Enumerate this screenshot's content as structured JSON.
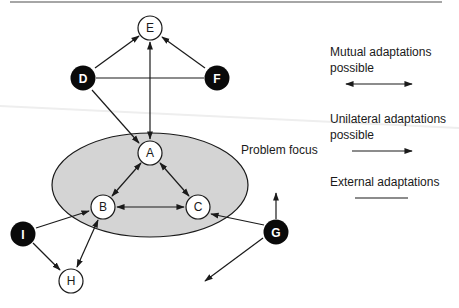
{
  "diagram": {
    "nodes": [
      {
        "id": "E",
        "label": "E",
        "type": "internal",
        "x": 150,
        "y": 28
      },
      {
        "id": "D",
        "label": "D",
        "type": "external",
        "x": 83,
        "y": 78
      },
      {
        "id": "F",
        "label": "F",
        "type": "external",
        "x": 217,
        "y": 78
      },
      {
        "id": "A",
        "label": "A",
        "type": "internal",
        "x": 150,
        "y": 153
      },
      {
        "id": "B",
        "label": "B",
        "type": "internal",
        "x": 103,
        "y": 207
      },
      {
        "id": "C",
        "label": "C",
        "type": "internal",
        "x": 198,
        "y": 207
      },
      {
        "id": "I",
        "label": "I",
        "type": "external",
        "x": 23,
        "y": 233
      },
      {
        "id": "H",
        "label": "H",
        "type": "internal",
        "x": 71,
        "y": 281
      },
      {
        "id": "G",
        "label": "G",
        "type": "external",
        "x": 276,
        "y": 232
      }
    ],
    "edges": [
      {
        "from": "D",
        "to": "E",
        "kind": "unilateral"
      },
      {
        "from": "F",
        "to": "E",
        "kind": "unilateral"
      },
      {
        "from": "D",
        "to": "F",
        "kind": "external"
      },
      {
        "from": "E",
        "to": "A",
        "kind": "mutual"
      },
      {
        "from": "D",
        "to": "A",
        "kind": "unilateral"
      },
      {
        "from": "A",
        "to": "B",
        "kind": "mutual"
      },
      {
        "from": "A",
        "to": "C",
        "kind": "mutual"
      },
      {
        "from": "B",
        "to": "C",
        "kind": "mutual"
      },
      {
        "from": "I",
        "to": "B",
        "kind": "unilateral"
      },
      {
        "from": "I",
        "to": "H",
        "kind": "unilateral"
      },
      {
        "from": "B",
        "to": "H",
        "kind": "mutual"
      },
      {
        "from": "G",
        "to": "C",
        "kind": "unilateral"
      },
      {
        "from": "G",
        "to": "up",
        "kind": "unilateral"
      },
      {
        "from": "G",
        "to": "down-left",
        "kind": "unilateral"
      }
    ],
    "problem_focus_label": "Problem focus"
  },
  "legend": {
    "mutual": "Mutual adaptations possible",
    "mutual_line1": "Mutual adaptations",
    "mutual_line2": "possible",
    "unilateral_line1": "Unilateral adaptations",
    "unilateral_line2": "possible",
    "external": "External adaptations"
  },
  "colors": {
    "focus_fill": "#d4d4d4",
    "external_node": "#0a0a0a",
    "line": "#1a1a1a"
  }
}
